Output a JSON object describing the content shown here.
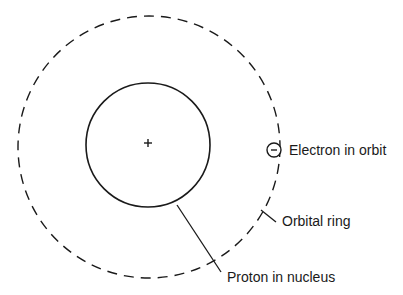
{
  "diagram": {
    "type": "atom-model",
    "colors": {
      "stroke": "#1a1a1a",
      "background": "#ffffff"
    },
    "nucleus": {
      "symbol": "+",
      "label": "Proton in nucleus"
    },
    "orbit": {
      "style": "dashed",
      "label": "Orbital ring"
    },
    "electron": {
      "symbol": "−",
      "label": "Electron in orbit"
    }
  }
}
